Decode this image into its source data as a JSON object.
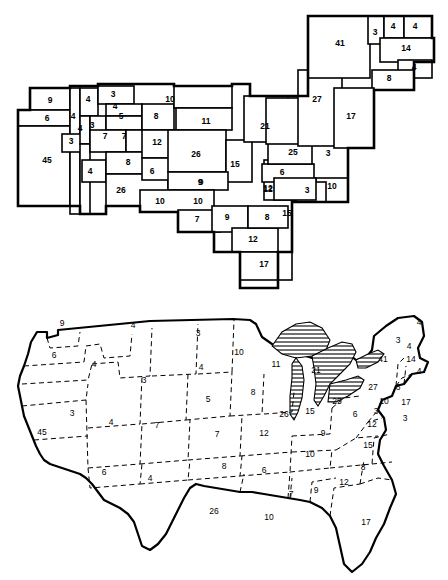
{
  "figure": {
    "title": ""
  },
  "chart_data": {
    "type": "map",
    "title": "",
    "subtitle": "",
    "xlabel": "",
    "ylabel": "",
    "legend": [],
    "value_label": "electoral votes",
    "panels": [
      {
        "id": "cartogram",
        "name": "electoral-vote-cartogram",
        "style": "rectilinear area cartogram, solid black boundaries"
      },
      {
        "id": "geographic",
        "name": "electoral-vote-geographic-map",
        "style": "conventional outline map, dashed state boundaries, hatched Great Lakes"
      }
    ],
    "states": [
      {
        "code": "CA",
        "name": "California",
        "votes": 45
      },
      {
        "code": "NY",
        "name": "New York",
        "votes": 41
      },
      {
        "code": "PA",
        "name": "Pennsylvania",
        "votes": 27
      },
      {
        "code": "TX",
        "name": "Texas",
        "votes": 26
      },
      {
        "code": "IL",
        "name": "Illinois",
        "votes": 26
      },
      {
        "code": "OH",
        "name": "Ohio",
        "votes": 25
      },
      {
        "code": "MI",
        "name": "Michigan",
        "votes": 21
      },
      {
        "code": "NJ",
        "name": "New Jersey",
        "votes": 17
      },
      {
        "code": "FL",
        "name": "Florida",
        "votes": 17
      },
      {
        "code": "MA",
        "name": "Massachusetts",
        "votes": 14
      },
      {
        "code": "IN",
        "name": "Indiana",
        "votes": 15
      },
      {
        "code": "NC",
        "name": "North Carolina",
        "votes": 15
      },
      {
        "code": "MO",
        "name": "Missouri",
        "votes": 12
      },
      {
        "code": "VA",
        "name": "Virginia",
        "votes": 12
      },
      {
        "code": "GA",
        "name": "Georgia",
        "votes": 12
      },
      {
        "code": "WI",
        "name": "Wisconsin",
        "votes": 11
      },
      {
        "code": "MN",
        "name": "Minnesota",
        "votes": 10
      },
      {
        "code": "TN",
        "name": "Tennessee",
        "votes": 10
      },
      {
        "code": "LA",
        "name": "Louisiana",
        "votes": 10
      },
      {
        "code": "MD",
        "name": "Maryland",
        "votes": 10
      },
      {
        "code": "WA",
        "name": "Washington",
        "votes": 9
      },
      {
        "code": "IA",
        "name": "Iowa",
        "votes": 9
      },
      {
        "code": "AL",
        "name": "Alabama",
        "votes": 9
      },
      {
        "code": "KY",
        "name": "Kentucky",
        "votes": 9
      },
      {
        "code": "OK",
        "name": "Oklahoma",
        "votes": 8
      },
      {
        "code": "SD",
        "name": "South Dakota",
        "votes": 8
      },
      {
        "code": "SC",
        "name": "South Carolina",
        "votes": 8
      },
      {
        "code": "CT",
        "name": "Connecticut",
        "votes": 8
      },
      {
        "code": "CO",
        "name": "Colorado",
        "votes": 7
      },
      {
        "code": "KS",
        "name": "Kansas",
        "votes": 7
      },
      {
        "code": "MS",
        "name": "Mississippi",
        "votes": 7
      },
      {
        "code": "OR",
        "name": "Oregon",
        "votes": 6
      },
      {
        "code": "AZ",
        "name": "Arizona",
        "votes": 6
      },
      {
        "code": "AR",
        "name": "Arkansas",
        "votes": 6
      },
      {
        "code": "WV",
        "name": "West Virginia",
        "votes": 6
      },
      {
        "code": "NE",
        "name": "Nebraska",
        "votes": 5
      },
      {
        "code": "ID",
        "name": "Idaho",
        "votes": 4
      },
      {
        "code": "MT",
        "name": "Montana",
        "votes": 4
      },
      {
        "code": "UT",
        "name": "Utah",
        "votes": 4
      },
      {
        "code": "NM",
        "name": "New Mexico",
        "votes": 4
      },
      {
        "code": "ME",
        "name": "Maine",
        "votes": 4
      },
      {
        "code": "NH",
        "name": "New Hampshire",
        "votes": 4
      },
      {
        "code": "RI",
        "name": "Rhode Island",
        "votes": 4
      },
      {
        "code": "NV",
        "name": "Nevada",
        "votes": 3
      },
      {
        "code": "WY",
        "name": "Wyoming",
        "votes": 3
      },
      {
        "code": "ND",
        "name": "North Dakota",
        "votes": 3
      },
      {
        "code": "VT",
        "name": "Vermont",
        "votes": 3
      },
      {
        "code": "DE",
        "name": "Delaware",
        "votes": 3
      },
      {
        "code": "DC",
        "name": "District of Columbia",
        "votes": 3
      }
    ]
  },
  "cartogram_labels": [
    {
      "name": "wa",
      "value": "9",
      "x": 50,
      "y": 101
    },
    {
      "name": "or",
      "value": "6",
      "x": 47,
      "y": 119
    },
    {
      "name": "id",
      "value": "4",
      "x": 73,
      "y": 117
    },
    {
      "name": "mt",
      "value": "4",
      "x": 88,
      "y": 100
    },
    {
      "name": "nd",
      "value": "3",
      "x": 113,
      "y": 95
    },
    {
      "name": "mn",
      "value": "10",
      "x": 170,
      "y": 100
    },
    {
      "name": "wy",
      "value": "4",
      "x": 115,
      "y": 107
    },
    {
      "name": "ne",
      "value": "5",
      "x": 121,
      "y": 117
    },
    {
      "name": "sd",
      "value": "8",
      "x": 156,
      "y": 117
    },
    {
      "name": "nv",
      "value": "3",
      "x": 92,
      "y": 126
    },
    {
      "name": "ut",
      "value": "4",
      "x": 80,
      "y": 129
    },
    {
      "name": "co",
      "value": "7",
      "x": 105,
      "y": 137
    },
    {
      "name": "ks",
      "value": "7",
      "x": 124,
      "y": 137
    },
    {
      "name": "wi",
      "value": "11",
      "x": 206,
      "y": 122
    },
    {
      "name": "mi",
      "value": "21",
      "x": 265,
      "y": 127
    },
    {
      "name": "mo",
      "value": "12",
      "x": 157,
      "y": 143
    },
    {
      "name": "az",
      "value": "3",
      "x": 71,
      "y": 142
    },
    {
      "name": "ca",
      "value": "45",
      "x": 47,
      "y": 161
    },
    {
      "name": "il",
      "value": "26",
      "x": 196,
      "y": 155
    },
    {
      "name": "in",
      "value": "15",
      "x": 235,
      "y": 165
    },
    {
      "name": "oh",
      "value": "25",
      "x": 293,
      "y": 153
    },
    {
      "name": "pa",
      "value": "27",
      "x": 317,
      "y": 100
    },
    {
      "name": "ny",
      "value": "41",
      "x": 340,
      "y": 44
    },
    {
      "name": "vt",
      "value": "3",
      "x": 375,
      "y": 33
    },
    {
      "name": "nh",
      "value": "4",
      "x": 393,
      "y": 27
    },
    {
      "name": "me",
      "value": "4",
      "x": 415,
      "y": 27
    },
    {
      "name": "ma",
      "value": "14",
      "x": 406,
      "y": 49
    },
    {
      "name": "ri",
      "value": "4",
      "x": 414,
      "y": 68
    },
    {
      "name": "ct",
      "value": "8",
      "x": 389,
      "y": 79
    },
    {
      "name": "nj",
      "value": "17",
      "x": 351,
      "y": 117
    },
    {
      "name": "wv",
      "value": "3",
      "x": 328,
      "y": 154
    },
    {
      "name": "nm",
      "value": "4",
      "x": 90,
      "y": 172
    },
    {
      "name": "ok",
      "value": "8",
      "x": 128,
      "y": 163
    },
    {
      "name": "ar",
      "value": "6",
      "x": 152,
      "y": 172
    },
    {
      "name": "ky",
      "value": "6",
      "x": 282,
      "y": 173
    },
    {
      "name": "va",
      "value": "12",
      "x": 268,
      "y": 190
    },
    {
      "name": "nc",
      "value": "3",
      "x": 307,
      "y": 191
    },
    {
      "name": "md",
      "value": "10",
      "x": 332,
      "y": 187
    },
    {
      "name": "tx",
      "value": "26",
      "x": 121,
      "y": 191
    },
    {
      "name": "tn",
      "value": "9",
      "x": 200,
      "y": 183
    },
    {
      "name": "la",
      "value": "10",
      "x": 160,
      "y": 202
    },
    {
      "name": "ms",
      "value": "10",
      "x": 198,
      "y": 202
    },
    {
      "name": "al",
      "value": "7",
      "x": 197,
      "y": 220
    },
    {
      "name": "ga",
      "value": "9",
      "x": 227,
      "y": 218
    },
    {
      "name": "sc",
      "value": "8",
      "x": 267,
      "y": 218
    },
    {
      "name": "de",
      "value": "15",
      "x": 287,
      "y": 214
    },
    {
      "name": "fl2",
      "value": "12",
      "x": 253,
      "y": 240
    },
    {
      "name": "fl",
      "value": "17",
      "x": 264,
      "y": 265
    },
    {
      "name": "ia",
      "value": "9",
      "x": 201,
      "y": 183
    },
    {
      "name": "ia2",
      "value": "12",
      "x": 268,
      "y": 189
    }
  ],
  "geomap_labels": [
    {
      "name": "wa",
      "value": "9",
      "x": 62,
      "y": 324
    },
    {
      "name": "or",
      "value": "6",
      "x": 54,
      "y": 356
    },
    {
      "name": "id",
      "value": "4",
      "x": 94,
      "y": 365
    },
    {
      "name": "mt",
      "value": "4",
      "x": 133,
      "y": 326
    },
    {
      "name": "nd",
      "value": "3",
      "x": 198,
      "y": 334
    },
    {
      "name": "mn",
      "value": "10",
      "x": 239,
      "y": 353
    },
    {
      "name": "wy",
      "value": "3",
      "x": 144,
      "y": 381
    },
    {
      "name": "sd",
      "value": "4",
      "x": 201,
      "y": 368
    },
    {
      "name": "wi",
      "value": "11",
      "x": 276,
      "y": 365
    },
    {
      "name": "mi",
      "value": "21",
      "x": 316,
      "y": 371
    },
    {
      "name": "ny",
      "value": "41",
      "x": 383,
      "y": 360
    },
    {
      "name": "vt",
      "value": "3",
      "x": 398,
      "y": 341
    },
    {
      "name": "nh",
      "value": "4",
      "x": 409,
      "y": 347
    },
    {
      "name": "me",
      "value": "4",
      "x": 419,
      "y": 323
    },
    {
      "name": "ma",
      "value": "14",
      "x": 411,
      "y": 360
    },
    {
      "name": "ri",
      "value": "4",
      "x": 419,
      "y": 372
    },
    {
      "name": "ct",
      "value": "8",
      "x": 398,
      "y": 388
    },
    {
      "name": "pa",
      "value": "27",
      "x": 373,
      "y": 388
    },
    {
      "name": "ia",
      "value": "8",
      "x": 253,
      "y": 393
    },
    {
      "name": "ne",
      "value": "5",
      "x": 208,
      "y": 400
    },
    {
      "name": "nv",
      "value": "3",
      "x": 72,
      "y": 414
    },
    {
      "name": "ut",
      "value": "4",
      "x": 111,
      "y": 423
    },
    {
      "name": "co",
      "value": "7",
      "x": 157,
      "y": 426
    },
    {
      "name": "ks",
      "value": "7",
      "x": 217,
      "y": 435
    },
    {
      "name": "mo",
      "value": "12",
      "x": 264,
      "y": 434
    },
    {
      "name": "il",
      "value": "26",
      "x": 284,
      "y": 415
    },
    {
      "name": "in",
      "value": "15",
      "x": 310,
      "y": 412
    },
    {
      "name": "oh",
      "value": "25",
      "x": 337,
      "y": 402
    },
    {
      "name": "ky",
      "value": "6",
      "x": 355,
      "y": 415
    },
    {
      "name": "wv",
      "value": "3",
      "x": 376,
      "y": 412
    },
    {
      "name": "md",
      "value": "10",
      "x": 384,
      "y": 402
    },
    {
      "name": "de",
      "value": "17",
      "x": 406,
      "y": 403
    },
    {
      "name": "dc",
      "value": "3",
      "x": 405,
      "y": 419
    },
    {
      "name": "va",
      "value": "12",
      "x": 372,
      "y": 425
    },
    {
      "name": "nc",
      "value": "15",
      "x": 368,
      "y": 446
    },
    {
      "name": "ca",
      "value": "45",
      "x": 42,
      "y": 433
    },
    {
      "name": "tn",
      "value": "9",
      "x": 323,
      "y": 434
    },
    {
      "name": "tn2",
      "value": "10",
      "x": 310,
      "y": 455
    },
    {
      "name": "az",
      "value": "6",
      "x": 104,
      "y": 473
    },
    {
      "name": "nm",
      "value": "4",
      "x": 150,
      "y": 479
    },
    {
      "name": "ok",
      "value": "8",
      "x": 224,
      "y": 467
    },
    {
      "name": "ar",
      "value": "6",
      "x": 264,
      "y": 471
    },
    {
      "name": "sc",
      "value": "8",
      "x": 363,
      "y": 468
    },
    {
      "name": "ga",
      "value": "12",
      "x": 344,
      "y": 483
    },
    {
      "name": "al",
      "value": "9",
      "x": 316,
      "y": 491
    },
    {
      "name": "ms",
      "value": "7",
      "x": 291,
      "y": 495
    },
    {
      "name": "tx",
      "value": "26",
      "x": 214,
      "y": 512
    },
    {
      "name": "la",
      "value": "10",
      "x": 269,
      "y": 518
    },
    {
      "name": "fl",
      "value": "17",
      "x": 366,
      "y": 523
    }
  ]
}
